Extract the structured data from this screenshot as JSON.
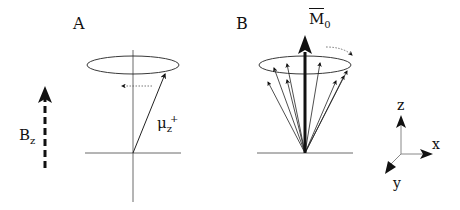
{
  "figure": {
    "panels": [
      {
        "id": "A",
        "label": "A",
        "field_label": "B",
        "field_subscript": "z",
        "moment_label": "μ",
        "moment_subscript": "z",
        "moment_superscript": "+"
      },
      {
        "id": "B",
        "label": "B",
        "magnetization_label": "M",
        "magnetization_subscript": "0"
      }
    ],
    "axes": {
      "z": "z",
      "x": "x",
      "y": "y"
    },
    "colors": {
      "ink": "#111111",
      "axis_gray": "#888888",
      "background": "#ffffff"
    }
  }
}
